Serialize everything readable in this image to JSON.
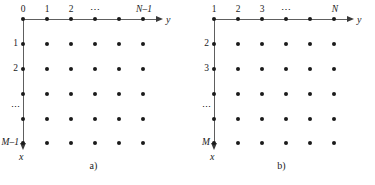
{
  "figure": {
    "type": "lattice-grid-diagram",
    "background": "#ffffff",
    "dot_color": "#1a1a1a",
    "axis_color": "#5e5e5e",
    "text_color": "#1b1b1b",
    "rows": 6,
    "cols": 6,
    "ellipsis_h": "⋯",
    "ellipsis_v": "⋮"
  },
  "panels": [
    {
      "id": "a",
      "caption": "a)",
      "indexing": "zero-based",
      "axes": {
        "horizontal": {
          "name": "y",
          "direction": "right"
        },
        "vertical": {
          "name": "x",
          "direction": "down"
        }
      },
      "column_labels": [
        "0",
        "1",
        "2",
        "⋯",
        "",
        "N–1"
      ],
      "row_labels": [
        "0",
        "1",
        "2",
        "",
        "⋮",
        "M–1"
      ],
      "column_label_styles": [
        "plain",
        "plain",
        "plain",
        "ellipsis",
        "none",
        "italic"
      ],
      "row_label_styles": [
        "none",
        "plain",
        "plain",
        "none",
        "ellipsis",
        "italic"
      ]
    },
    {
      "id": "b",
      "caption": "b)",
      "indexing": "one-based",
      "axes": {
        "horizontal": {
          "name": "y",
          "direction": "right"
        },
        "vertical": {
          "name": "x",
          "direction": "down"
        }
      },
      "column_labels": [
        "1",
        "2",
        "3",
        "⋯",
        "",
        "N"
      ],
      "row_labels": [
        "1",
        "2",
        "3",
        "",
        "⋮",
        "M"
      ],
      "column_label_styles": [
        "plain",
        "plain",
        "plain",
        "ellipsis",
        "none",
        "italic"
      ],
      "row_label_styles": [
        "none",
        "plain",
        "plain",
        "none",
        "ellipsis",
        "italic"
      ]
    }
  ]
}
